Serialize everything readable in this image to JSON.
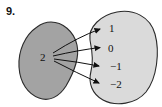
{
  "problem_number": "9.",
  "diagram": {
    "type": "mapping-diagram",
    "domain": {
      "elements": [
        "2"
      ]
    },
    "codomain": {
      "elements": [
        "1",
        "0",
        "−1",
        "−2"
      ]
    },
    "mappings": [
      {
        "from": "2",
        "to": "1"
      },
      {
        "from": "2",
        "to": "0"
      },
      {
        "from": "2",
        "to": "−1"
      },
      {
        "from": "2",
        "to": "−2"
      }
    ],
    "colors": {
      "domain_fill": "#a3a3a3",
      "codomain_fill": "#dadada",
      "outline": "#2a2a2a",
      "arrow": "#101010"
    }
  }
}
